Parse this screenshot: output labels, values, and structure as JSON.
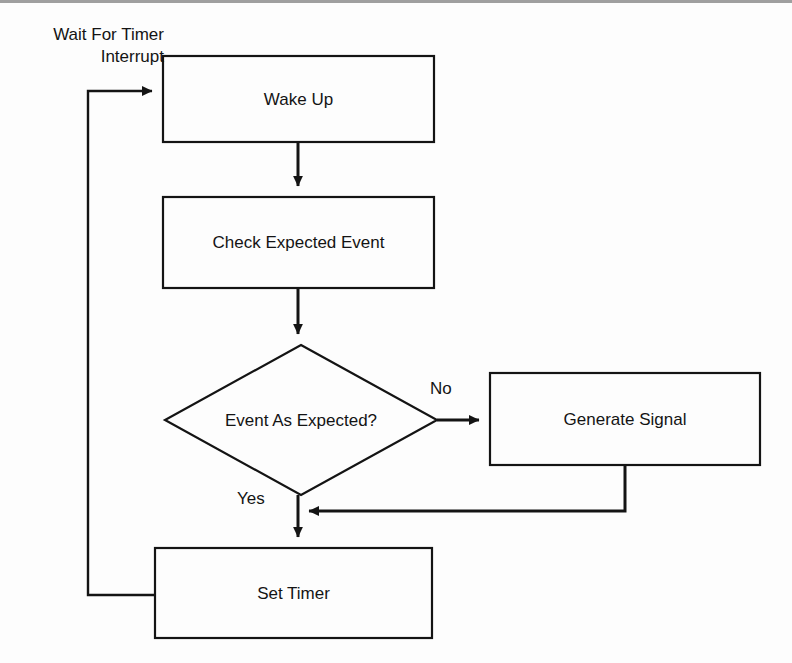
{
  "diagram": {
    "background_color": "#fdfdfd",
    "stroke_color": "#141414",
    "fill_color": "#fdfdfd",
    "annotation": {
      "wait_for_timer_interrupt": "Wait For Timer\nInterrupt"
    },
    "nodes": [
      {
        "id": "wake-up",
        "label": "Wake Up",
        "shape": "rectangle",
        "x": 163,
        "y": 56,
        "width": 271,
        "height": 86
      },
      {
        "id": "check-expected-event",
        "label": "Check Expected Event",
        "shape": "rectangle",
        "x": 163,
        "y": 197,
        "width": 271,
        "height": 91
      },
      {
        "id": "event-as-expected",
        "label": "Event As Expected?",
        "shape": "diamond",
        "x": 165,
        "y": 345,
        "width": 272,
        "height": 150
      },
      {
        "id": "generate-signal",
        "label": "Generate Signal",
        "shape": "rectangle",
        "x": 490,
        "y": 373,
        "width": 270,
        "height": 92
      },
      {
        "id": "set-timer",
        "label": "Set Timer",
        "shape": "rectangle",
        "x": 155,
        "y": 548,
        "width": 277,
        "height": 90
      }
    ],
    "edges": [
      {
        "id": "wake-to-check",
        "from": "wake-up",
        "to": "check-expected-event",
        "label": ""
      },
      {
        "id": "check-to-decision",
        "from": "check-expected-event",
        "to": "event-as-expected",
        "label": ""
      },
      {
        "id": "decision-no",
        "from": "event-as-expected",
        "to": "generate-signal",
        "label": "No"
      },
      {
        "id": "decision-yes",
        "from": "event-as-expected",
        "to": "set-timer",
        "label": "Yes"
      },
      {
        "id": "signal-back-to-yes",
        "from": "generate-signal",
        "to": "set-timer",
        "label": ""
      },
      {
        "id": "timer-back-to-wake",
        "from": "set-timer",
        "to": "wake-up",
        "label": "Wait For Timer Interrupt"
      }
    ]
  }
}
